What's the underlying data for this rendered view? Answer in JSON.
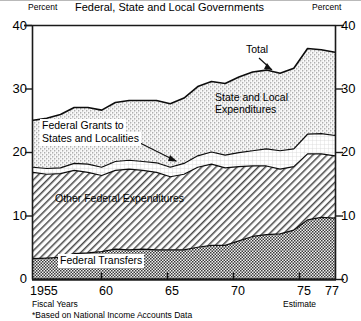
{
  "chart_data": {
    "type": "area",
    "title": "Federal, State and Local Governments",
    "subtitle": "",
    "xlabel": "Fiscal Years",
    "ylabel": "Percent",
    "ylabel_right": "Percent",
    "ylim": [
      0,
      40
    ],
    "xlim": [
      1955,
      1977
    ],
    "yticks": [
      0,
      10,
      20,
      30,
      40
    ],
    "ytick_labels": [
      "0",
      "10",
      "20",
      "30",
      "40"
    ],
    "xticks": [
      1955,
      1960,
      1965,
      1970,
      1975,
      1977
    ],
    "xtick_labels": [
      "1955",
      "60",
      "65",
      "70",
      "75",
      "77"
    ],
    "grid": false,
    "legend": "in-plot annotations",
    "footnote": "*Based on National Income Accounts Data",
    "estimate_note": "Estimate",
    "annotations": [
      {
        "text": "Total",
        "points_to": "top of stacked area near 1973"
      },
      {
        "text": "State and Local Expenditures",
        "points_to": "upper stippled band"
      },
      {
        "text": "Federal Grants to States and Localities",
        "points_to": "thin white band near 19 percent"
      },
      {
        "text": "Other Federal Expenditures",
        "points_to": "diagonal hatch band"
      },
      {
        "text": "Federal Transfers",
        "points_to": "bottom checkered band"
      }
    ],
    "x": [
      1955,
      1956,
      1957,
      1958,
      1959,
      1960,
      1961,
      1962,
      1963,
      1964,
      1965,
      1966,
      1967,
      1968,
      1969,
      1970,
      1971,
      1972,
      1973,
      1974,
      1975,
      1976,
      1977
    ],
    "series": [
      {
        "name": "Federal Transfers",
        "pattern": "dark-checker",
        "values": [
          3.2,
          3.3,
          3.4,
          4.0,
          4.1,
          4.3,
          4.7,
          4.6,
          4.7,
          4.6,
          4.6,
          4.6,
          5.0,
          5.3,
          5.3,
          6.0,
          6.7,
          7.0,
          7.1,
          7.7,
          9.3,
          9.7,
          9.6
        ]
      },
      {
        "name": "Other Federal Expenditures",
        "pattern": "diagonal-hatch",
        "values": [
          13.6,
          13.2,
          13.2,
          13.1,
          12.7,
          12.0,
          12.4,
          12.7,
          12.4,
          12.2,
          11.5,
          11.9,
          12.6,
          12.8,
          12.2,
          11.7,
          11.1,
          10.8,
          10.2,
          10.0,
          10.4,
          10.0,
          9.8
        ]
      },
      {
        "name": "Federal Grants to States and Localities",
        "pattern": "white",
        "values": [
          0.8,
          0.9,
          0.9,
          1.1,
          1.3,
          1.3,
          1.4,
          1.4,
          1.4,
          1.5,
          1.5,
          1.7,
          1.8,
          1.9,
          2.0,
          2.2,
          2.4,
          2.7,
          2.9,
          2.8,
          3.1,
          3.2,
          3.2
        ]
      },
      {
        "name": "State and Local Expenditures",
        "pattern": "stipple",
        "values": [
          7.4,
          7.9,
          8.4,
          8.8,
          8.9,
          9.0,
          9.3,
          9.4,
          9.6,
          9.8,
          10.0,
          10.3,
          10.9,
          11.1,
          11.3,
          11.9,
          12.4,
          12.4,
          12.2,
          12.7,
          13.5,
          13.2,
          13.1
        ]
      }
    ],
    "total": [
      25.0,
      25.3,
      25.9,
      27.0,
      27.0,
      26.6,
      27.8,
      28.1,
      28.1,
      28.1,
      27.6,
      28.5,
      30.3,
      31.1,
      30.8,
      31.8,
      32.6,
      32.9,
      32.4,
      33.2,
      36.3,
      36.1,
      35.7
    ]
  },
  "labels": {
    "percent_left": "Percent",
    "percent_right": "Percent",
    "title": "Federal, State and Local Governments",
    "total": "Total",
    "state_local_1": "State and Local",
    "state_local_2": "Expenditures",
    "grants_1": "Federal Grants to",
    "grants_2": "States and Localities",
    "other_federal": "Other Federal Expenditures",
    "federal_transfers": "Federal Transfers",
    "fiscal_years": "Fiscal Years",
    "estimate": "Estimate",
    "footnote": "*Based on National Income Accounts Data",
    "y0": "0",
    "y10": "10",
    "y20": "20",
    "y30": "30",
    "y40": "40",
    "y0r": "0",
    "y10r": "10",
    "y20r": "20",
    "y30r": "30",
    "y40r": "40",
    "x1955": "1955",
    "x60": "60",
    "x65": "65",
    "x70": "70",
    "x75": "75",
    "x77": "77"
  }
}
